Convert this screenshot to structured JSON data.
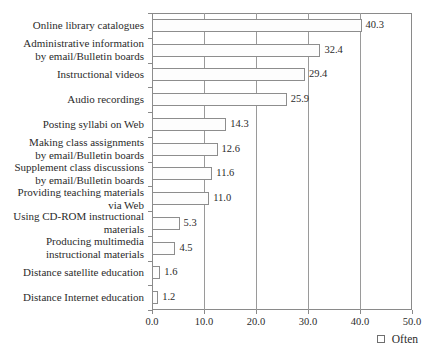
{
  "chart_data": {
    "type": "bar",
    "orientation": "horizontal",
    "title": "",
    "xlabel": "",
    "ylabel": "",
    "xlim": [
      0.0,
      50.0
    ],
    "xticks": [
      "0.0",
      "10.0",
      "20.0",
      "30.0",
      "40.0",
      "50.0"
    ],
    "xtick_values": [
      0,
      10,
      20,
      30,
      40,
      50
    ],
    "grid": "vertical",
    "legend": {
      "position": "bottom-right",
      "entries": [
        {
          "label": "Often",
          "marker": "open-square",
          "color": "#ffffff"
        }
      ]
    },
    "categories": [
      "Online library catalogues",
      "Administrative information\nby email/Bulletin boards",
      "Instructional videos",
      "Audio recordings",
      "Posting syllabi on Web",
      "Making class assignments\nby email/Bulletin boards",
      "Supplement class discussions\nby email/Bulletin boards",
      "Providing teaching materials\nvia Web",
      "Using CD-ROM instructional\nmaterials",
      "Producing multimedia\ninstructional materials",
      "Distance satellite education",
      "Distance Internet education"
    ],
    "values": [
      40.3,
      32.4,
      29.4,
      25.9,
      14.3,
      12.6,
      11.6,
      11.0,
      5.3,
      4.5,
      1.6,
      1.2
    ],
    "value_labels": [
      "40.3",
      "32.4",
      "29.4",
      "25.9",
      "14.3",
      "12.6",
      "11.6",
      "11.0",
      "5.3",
      "4.5",
      "1.6",
      "1.2"
    ],
    "series": [
      {
        "name": "Often",
        "values": [
          40.3,
          32.4,
          29.4,
          25.9,
          14.3,
          12.6,
          11.6,
          11.0,
          5.3,
          4.5,
          1.6,
          1.2
        ]
      }
    ]
  }
}
